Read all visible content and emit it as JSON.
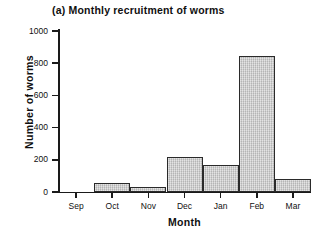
{
  "figure": {
    "panel_label": "(a)",
    "title": "(a) Monthly recruitment of worms"
  },
  "axes": {
    "y_title": "Number of worms",
    "x_title": "Month",
    "y_ticks": [
      "0",
      "200",
      "400",
      "600",
      "800",
      "1000"
    ],
    "x_ticks": [
      "Sep",
      "Oct",
      "Nov",
      "Dec",
      "Jan",
      "Feb",
      "Mar"
    ]
  },
  "style": {
    "bar_fill": "#c9c9c9",
    "bar_edge": "#2a2a2a",
    "axis_color": "#1a1a1a",
    "background": "#ffffff"
  },
  "chart_data": {
    "type": "bar",
    "title": "(a) Monthly recruitment of worms",
    "xlabel": "Month",
    "ylabel": "Number of worms",
    "categories": [
      "Sep",
      "Oct",
      "Nov",
      "Dec",
      "Jan",
      "Feb",
      "Mar"
    ],
    "values": [
      0,
      55,
      30,
      215,
      170,
      845,
      80
    ],
    "ylim": [
      0,
      1000
    ],
    "yticks": [
      0,
      200,
      400,
      600,
      800,
      1000
    ],
    "grid": false,
    "legend": null
  }
}
